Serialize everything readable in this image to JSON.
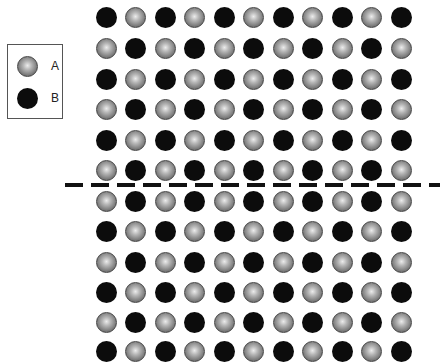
{
  "legend": {
    "items": [
      {
        "type": "A",
        "label": "A"
      },
      {
        "type": "B",
        "label": "B"
      }
    ]
  },
  "colors": {
    "A_center": "#ececec",
    "A_edge": "#4a4a4a",
    "B_fill": "#0c0c0c",
    "boundary_line": "#111111"
  },
  "lattice": {
    "columns": 11,
    "rows_above_boundary": [
      "BABABABABAB",
      "ABABABABABA",
      "BABABABABAB",
      "ABABABABABA",
      "BABABABABAB",
      "ABABABABABA"
    ],
    "rows_below_boundary": [
      "ABABABABABA",
      "BABABABABAB",
      "ABABABABABA",
      "BABABABABAB",
      "ABABABABABA",
      "BABABABABAB"
    ],
    "boundary": "dashed-line"
  }
}
